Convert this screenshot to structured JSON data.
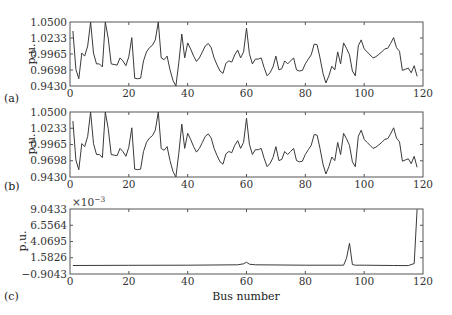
{
  "chart_data": [
    {
      "panel": "(a)",
      "type": "line",
      "title": "",
      "xlabel": "",
      "ylabel": "p.u.",
      "xlim": [
        0,
        120
      ],
      "ylim": [
        0.943,
        1.05
      ],
      "xticks": [
        "0",
        "20",
        "40",
        "60",
        "80",
        "100",
        "120"
      ],
      "yticks": [
        "0.9430",
        "0.9698",
        "0.9965",
        "1.0233",
        "1.0500"
      ],
      "grid": false,
      "x": [
        1,
        2,
        3,
        4,
        5,
        6,
        7,
        8,
        9,
        10,
        11,
        12,
        13,
        14,
        15,
        16,
        17,
        18,
        19,
        20,
        21,
        22,
        23,
        24,
        25,
        26,
        27,
        28,
        29,
        30,
        31,
        32,
        33,
        34,
        35,
        36,
        37,
        38,
        39,
        40,
        41,
        42,
        43,
        44,
        45,
        46,
        47,
        48,
        49,
        50,
        51,
        52,
        53,
        54,
        55,
        56,
        57,
        58,
        59,
        60,
        61,
        62,
        63,
        64,
        65,
        66,
        67,
        68,
        69,
        70,
        71,
        72,
        73,
        74,
        75,
        76,
        77,
        78,
        79,
        80,
        81,
        82,
        83,
        84,
        85,
        86,
        87,
        88,
        89,
        90,
        91,
        92,
        93,
        94,
        95,
        96,
        97,
        98,
        99,
        100,
        101,
        102,
        103,
        104,
        105,
        106,
        107,
        108,
        109,
        110,
        111,
        112,
        113,
        114,
        115,
        116,
        117,
        118
      ],
      "values": [
        1.035,
        0.971,
        0.955,
        0.998,
        0.993,
        1.01,
        1.05,
        0.998,
        0.98,
        0.98,
        0.975,
        1.05,
        1.023,
        0.98,
        0.979,
        0.978,
        0.99,
        0.985,
        0.977,
        0.992,
        1.024,
        0.956,
        0.955,
        0.956,
        0.985,
        1.0,
        1.007,
        1.011,
        1.02,
        1.05,
        0.99,
        0.987,
        0.993,
        0.97,
        0.952,
        0.943,
        0.982,
        1.03,
        0.99,
        1.015,
        1.005,
        0.993,
        0.984,
        0.99,
        1.0,
        1.01,
        1.014,
        1.007,
        0.99,
        0.978,
        0.968,
        0.964,
        0.981,
        0.985,
        0.983,
        0.995,
        1.003,
        0.99,
        1.0,
        1.04,
        0.997,
        0.98,
        0.988,
        0.988,
        0.99,
        0.974,
        0.96,
        0.965,
        0.975,
        0.993,
        0.97,
        0.972,
        0.985,
        0.98,
        0.985,
        0.99,
        0.97,
        0.968,
        0.969,
        0.98,
        0.988,
        0.995,
        1.013,
        1.012,
        0.99,
        0.964,
        0.948,
        0.96,
        0.976,
        0.97,
        1.0,
        0.98,
        1.015,
        1.006,
        0.995,
        0.968,
        0.96,
        1.01,
        1.02,
        1.005,
        1.0,
        0.995,
        0.99,
        0.992,
        0.996,
        1.0,
        1.005,
        1.006,
        1.014,
        1.024,
        1.007,
        1.001,
        0.969,
        0.971,
        0.973,
        0.965,
        0.977,
        0.959
      ]
    },
    {
      "panel": "(b)",
      "type": "line",
      "title": "",
      "xlabel": "",
      "ylabel": "p.u.",
      "xlim": [
        0,
        120
      ],
      "ylim": [
        0.943,
        1.05
      ],
      "xticks": [
        "0",
        "20",
        "40",
        "60",
        "80",
        "100",
        "120"
      ],
      "yticks": [
        "0.9430",
        "0.9698",
        "0.9965",
        "1.0233",
        "1.0500"
      ],
      "grid": false,
      "note": "nearly identical to panel (a)",
      "x_ref": "same as panel (a)",
      "values_ref": "same as panel (a)"
    },
    {
      "panel": "(c)",
      "type": "line",
      "title": "",
      "xlabel": "Bus number",
      "ylabel": "p.u.",
      "scale_annotation": "×10^-3",
      "xlim": [
        0,
        120
      ],
      "ylim": [
        -0.9043,
        9.0433
      ],
      "xticks": [
        "0",
        "20",
        "40",
        "60",
        "80",
        "100",
        "120"
      ],
      "yticks": [
        "-0.9043",
        "1.5826",
        "4.0695",
        "6.5564",
        "9.0433"
      ],
      "grid": false,
      "x": [
        1,
        20,
        40,
        57,
        59,
        60,
        61,
        63,
        80,
        93,
        94,
        95,
        96,
        97,
        100,
        110,
        115,
        117,
        118
      ],
      "values": [
        0.4,
        0.42,
        0.45,
        0.5,
        0.65,
        0.9,
        0.6,
        0.5,
        0.45,
        0.45,
        1.5,
        3.8,
        0.55,
        0.45,
        0.45,
        0.4,
        0.38,
        0.7,
        9.0
      ]
    }
  ],
  "panels": {
    "a": {
      "tag": "(a)"
    },
    "b": {
      "tag": "(b)"
    },
    "c": {
      "tag": "(c)",
      "exponent_base": "×10",
      "exponent": "−3"
    }
  },
  "axes": {
    "ylabel": "p.u.",
    "xlabel": "Bus number",
    "volt_ticks": [
      "0.9430",
      "0.9698",
      "0.9965",
      "1.0233",
      "1.0500"
    ],
    "c_ticks": [
      "−0.9043",
      "1.5826",
      "4.0695",
      "6.5564",
      "9.0433"
    ],
    "x_ticks": [
      "0",
      "20",
      "40",
      "60",
      "80",
      "100",
      "120"
    ]
  },
  "colors": {
    "line": "#3a3a3a",
    "axis": "#555555",
    "background": "#ffffff"
  }
}
